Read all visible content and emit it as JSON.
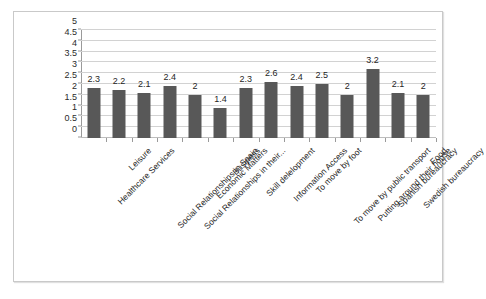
{
  "chart_data": {
    "type": "bar",
    "title": "",
    "subtitle": "",
    "xlabel": "",
    "ylabel": "",
    "ylim": [
      0,
      5
    ],
    "ytick_step": 0.5,
    "yticks": [
      "5",
      "4.5",
      "4",
      "3.5",
      "3",
      "2.5",
      "2",
      "1.5",
      "1",
      "0.5",
      "0"
    ],
    "grid": true,
    "legend": "none",
    "data_labels": true,
    "bar_color": "#585858",
    "gridline_color": "#d2d2d2",
    "plot_border_color": "#c9c9c9",
    "categories": [
      "Healthcare Services",
      "Leisure",
      "Social Relationships in Spain",
      "Social Relationships in their...",
      "Economic Matters",
      "Business",
      "Skill delelopment",
      "Information Access",
      "To move by foot",
      "To move by public transport",
      "Putting around their house",
      "Spanish bureaucracy",
      "Swedish bureaucracy",
      "Food"
    ],
    "values": [
      2.3,
      2.2,
      2.1,
      2.4,
      2,
      1.4,
      2.3,
      2.6,
      2.4,
      2.5,
      2,
      3.2,
      2.1,
      2
    ],
    "value_labels": [
      "2.3",
      "2.2",
      "2.1",
      "2.4",
      "2",
      "1.4",
      "2.3",
      "2.6",
      "2.4",
      "2.5",
      "2",
      "3.2",
      "2.1",
      "2"
    ]
  },
  "caption": {
    "text": ""
  }
}
